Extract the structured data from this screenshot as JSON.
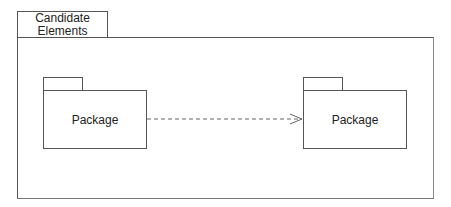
{
  "diagram": {
    "type": "UML package diagram",
    "frame": {
      "label": "Candidate Elements",
      "label_lines": [
        "Candidate",
        "Elements"
      ]
    },
    "packages": [
      {
        "id": "left",
        "label": "Package"
      },
      {
        "id": "right",
        "label": "Package"
      }
    ],
    "relationships": [
      {
        "from": "left",
        "to": "right",
        "style": "dashed",
        "arrowhead": "open",
        "kind": "dependency"
      }
    ],
    "colors": {
      "line": "#555555",
      "background": "#ffffff",
      "text": "#222222"
    }
  }
}
